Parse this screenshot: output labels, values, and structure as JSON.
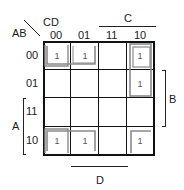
{
  "kmap": {
    "row_var_label": "AB",
    "col_var_label": "CD",
    "col_headers": [
      "00",
      "01",
      "11",
      "10"
    ],
    "row_headers": [
      "00",
      "01",
      "11",
      "10"
    ],
    "cells": [
      [
        "1",
        "1",
        "",
        "1"
      ],
      [
        "",
        "",
        "",
        "1"
      ],
      [
        "",
        "",
        "",
        ""
      ],
      [
        "1",
        "1",
        "",
        "1"
      ]
    ],
    "brackets": {
      "top": "C",
      "right": "B",
      "left": "A",
      "bottom": "D"
    },
    "group_color": "#8a8a8a",
    "line_color": "#111111"
  }
}
